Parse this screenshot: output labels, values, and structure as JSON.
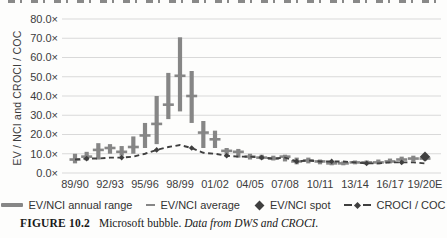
{
  "figure": {
    "caption_label": "FIGURE 10.2",
    "caption_title": "Microsoft bubble.",
    "caption_source": "Data from DWS and CROCI."
  },
  "chart_data": {
    "type": "bar",
    "subtype": "high-low range bars with average ticks, spot marker and dashed line",
    "title": "",
    "xlabel": "",
    "ylabel": "EV / NCI and CROCI / COC",
    "ylim": [
      0,
      80
    ],
    "ytick_step": 10,
    "ytick_suffix": "×",
    "grid": "horizontal",
    "legend_position": "bottom",
    "x_tick_every": 3,
    "categories": [
      "89/90",
      "90/91",
      "91/92",
      "92/93",
      "93/94",
      "94/95",
      "95/96",
      "96/97",
      "97/98",
      "98/99",
      "99/00",
      "00/01",
      "01/02",
      "02/03",
      "03/04",
      "04/05",
      "05/06",
      "06/07",
      "07/08",
      "08/09",
      "09/10",
      "10/11",
      "11/12",
      "12/13",
      "13/14",
      "14/15",
      "15/16",
      "16/17",
      "17/18",
      "18/19",
      "19/20E"
    ],
    "series": [
      {
        "name": "EV/NCI annual range",
        "style": "range-bar",
        "color": "#868686",
        "low": [
          5,
          6.5,
          7,
          10,
          9,
          10,
          13,
          15,
          28,
          32,
          26,
          13,
          13,
          8.5,
          8,
          7,
          7,
          6.5,
          6,
          4.5,
          5,
          4.5,
          4,
          4,
          4.5,
          4.5,
          4.5,
          5,
          5.5,
          6,
          6.5
        ],
        "high": [
          10,
          11,
          15.5,
          15,
          14,
          19,
          26,
          40,
          52,
          70.5,
          53,
          27,
          22,
          13,
          12.5,
          10,
          9.5,
          9,
          9.5,
          8,
          8,
          7,
          6,
          6,
          6.5,
          6.5,
          7,
          7.5,
          8.5,
          9,
          9
        ]
      },
      {
        "name": "EV/NCI average",
        "style": "tick",
        "color": "#868686",
        "values": [
          7,
          8.5,
          12,
          13,
          11,
          13.5,
          19.5,
          25.5,
          35.5,
          50.5,
          40,
          21,
          17.5,
          11.5,
          11,
          8.5,
          8,
          7.5,
          8.5,
          6,
          6.5,
          6,
          5,
          5,
          5.5,
          5.5,
          5.5,
          6,
          7,
          7.5,
          7.5
        ]
      },
      {
        "name": "EV/NCI spot",
        "style": "diamond",
        "color": "#3f3f3f",
        "values": [
          null,
          null,
          null,
          null,
          null,
          null,
          null,
          null,
          null,
          null,
          null,
          null,
          null,
          null,
          null,
          null,
          null,
          null,
          null,
          null,
          null,
          null,
          null,
          null,
          null,
          null,
          null,
          null,
          null,
          null,
          8.5
        ]
      },
      {
        "name": "CROCI / COC",
        "style": "dashed-line",
        "color": "#3f3f3f",
        "values": [
          7,
          7.5,
          7.5,
          8,
          8,
          8.5,
          10,
          12,
          13.5,
          14.5,
          13,
          10.5,
          10,
          9,
          8.5,
          8.5,
          8,
          7.5,
          8,
          6,
          6.5,
          6,
          6,
          6,
          5.5,
          5,
          5,
          5.5,
          5.5,
          5.5,
          5
        ]
      }
    ]
  }
}
